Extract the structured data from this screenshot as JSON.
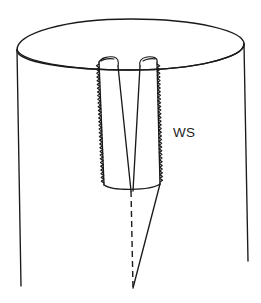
{
  "figure": {
    "kind": "technical-line-drawing",
    "background_color": "#ffffff",
    "ink_color": "#1a1a1a",
    "canvas": {
      "width": 261,
      "height": 303
    },
    "annotations": [
      {
        "id": "ws",
        "label": "WS",
        "x": 173,
        "y": 137,
        "points_to": "serrated-slot-wall-right"
      }
    ],
    "parts": {
      "cylinder_label": "cylinder body",
      "top_ellipse_label": "cylinder top face",
      "slot_label": "V-shaped notch",
      "left_wall_label": "left notch wall",
      "right_wall_label": "right notch wall",
      "serration_label": "serrated (weld) edge",
      "centerline_label": "centerline",
      "wedge_label": "wedge crack extension"
    },
    "geometry": {
      "top_ellipse": "M 17,50 C 17,33 66,19 131,19 C 197,19 244,31 244,44 C 244,57 196,70 131,70 C 66,70 17,62 17,50 Z",
      "top_ellipse_front": "M 17,50 C 22,61 66,70 131,70 C 196,70 244,57 244,44",
      "left_side": "M 17,50 L 21,286",
      "right_side": "M 244,44 L 248,261",
      "slot_left_outer": "M 99,62 L 104,185",
      "slot_left_inner": "M 118,66 L 131,191",
      "slot_right_inner": "M 140,66 L 133,191",
      "slot_right_outer": "M 157,62 L 160,184",
      "slot_bottom": "M 104,185 C 112,191 150,191 160,184",
      "left_cap": "M 99,62 C 101,58 108,56 114,57 C 118,58 119,62 118,66",
      "left_cap_inner": "M 101,61 C 104,59 110,58 114,59",
      "right_cap": "M 140,66 C 139,61 141,58 147,57 C 153,56 158,58 157,62",
      "right_cap_inner": "M 143,61 C 146,59 152,58 155,59",
      "centerline": "M 131,191 L 133,288",
      "wedge_edge": "M 160,184 L 133,288",
      "serration_left": {
        "x_top": 99,
        "y_top": 64,
        "x_bot": 104,
        "y_bot": 183,
        "teeth": 32,
        "amplitude": 2.6
      },
      "serration_right": {
        "x_top": 157,
        "y_top": 64,
        "x_bot": 160,
        "y_bot": 182,
        "teeth": 32,
        "amplitude": 2.6
      }
    }
  }
}
